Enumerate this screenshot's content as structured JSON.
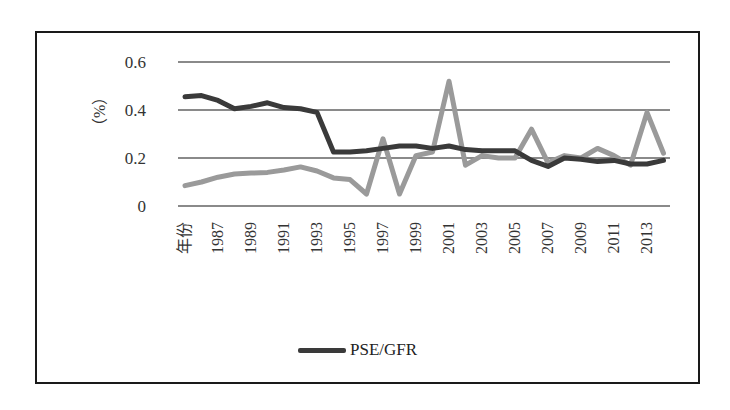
{
  "chart_data": {
    "type": "line",
    "title": "",
    "xlabel": "",
    "ylabel": "（%）",
    "ylim": [
      0,
      0.6
    ],
    "yticks": [
      "0",
      "0.2",
      "0.4",
      "0.6"
    ],
    "grid": true,
    "legend_position": "bottom",
    "categories": [
      "年份",
      "1986",
      "1987",
      "1988",
      "1989",
      "1990",
      "1991",
      "1992",
      "1993",
      "1994",
      "1995",
      "1996",
      "1997",
      "1998",
      "1999",
      "2000",
      "2001",
      "2002",
      "2003",
      "2004",
      "2005",
      "2006",
      "2007",
      "2008",
      "2009",
      "2010",
      "2011",
      "2012",
      "2013",
      "2014"
    ],
    "xtick_labels": [
      "年份",
      "1987",
      "1989",
      "1991",
      "1993",
      "1995",
      "1997",
      "1999",
      "2001",
      "2003",
      "2005",
      "2007",
      "2009",
      "2011",
      "2013"
    ],
    "series": [
      {
        "name": "PSE/GFR",
        "color": "#3a3a3a",
        "values": [
          0.455,
          0.46,
          0.44,
          0.405,
          0.415,
          0.43,
          0.41,
          0.405,
          0.39,
          0.225,
          0.225,
          0.23,
          0.24,
          0.25,
          0.25,
          0.24,
          0.25,
          0.235,
          0.23,
          0.23,
          0.23,
          0.19,
          0.165,
          0.2,
          0.195,
          0.185,
          0.19,
          0.175,
          0.175,
          0.19
        ]
      },
      {
        "name": "",
        "color": "#9a9a9a",
        "values": [
          0.085,
          0.1,
          0.12,
          0.133,
          0.137,
          0.14,
          0.15,
          0.163,
          0.146,
          0.117,
          0.11,
          0.05,
          0.28,
          0.05,
          0.21,
          0.225,
          0.52,
          0.17,
          0.21,
          0.2,
          0.2,
          0.32,
          0.18,
          0.21,
          0.2,
          0.24,
          0.21,
          0.17,
          0.39,
          0.22
        ]
      }
    ]
  },
  "axis": {
    "ylabel": "（%）"
  },
  "legend": {
    "label": "PSE/GFR"
  }
}
